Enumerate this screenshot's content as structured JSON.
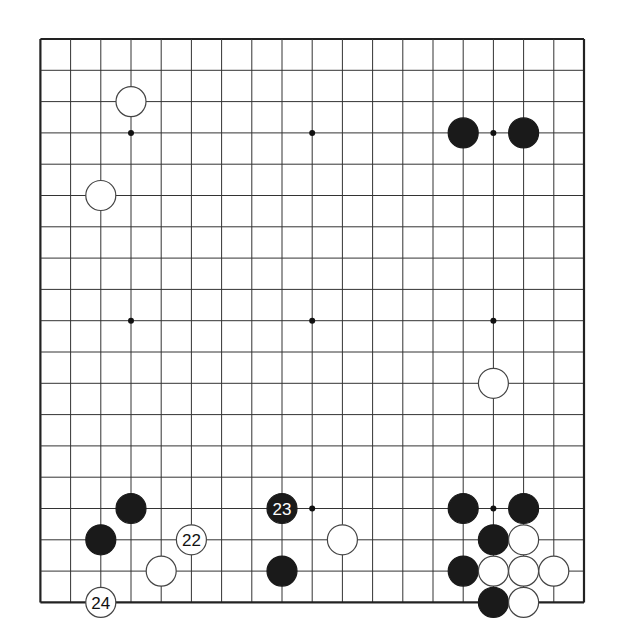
{
  "board": {
    "size": 19,
    "origin_x": 40.4,
    "origin_y": 39,
    "spacing_x": 30.2,
    "spacing_y": 31.3,
    "stone_radius": 15,
    "line_color": "#333333",
    "border_color": "#222222",
    "black_color": "#1a1a1a",
    "white_color": "#ffffff",
    "star_points": [
      [
        3,
        3
      ],
      [
        9,
        3
      ],
      [
        15,
        3
      ],
      [
        3,
        9
      ],
      [
        9,
        9
      ],
      [
        15,
        9
      ],
      [
        3,
        15
      ],
      [
        9,
        15
      ],
      [
        15,
        15
      ]
    ]
  },
  "stones": [
    {
      "color": "white",
      "col": 3,
      "row": 2,
      "label": ""
    },
    {
      "color": "white",
      "col": 2,
      "row": 5,
      "label": ""
    },
    {
      "color": "black",
      "col": 14,
      "row": 3,
      "label": ""
    },
    {
      "color": "black",
      "col": 16,
      "row": 3,
      "label": ""
    },
    {
      "color": "white",
      "col": 15,
      "row": 11,
      "label": ""
    },
    {
      "color": "black",
      "col": 3,
      "row": 15,
      "label": ""
    },
    {
      "color": "black",
      "col": 2,
      "row": 16,
      "label": ""
    },
    {
      "color": "white",
      "col": 5,
      "row": 16,
      "label": "22"
    },
    {
      "color": "white",
      "col": 4,
      "row": 17,
      "label": ""
    },
    {
      "color": "white",
      "col": 2,
      "row": 18,
      "label": "24"
    },
    {
      "color": "black",
      "col": 8,
      "row": 15,
      "label": "23"
    },
    {
      "color": "white",
      "col": 10,
      "row": 16,
      "label": ""
    },
    {
      "color": "black",
      "col": 8,
      "row": 17,
      "label": ""
    },
    {
      "color": "black",
      "col": 14,
      "row": 15,
      "label": ""
    },
    {
      "color": "black",
      "col": 16,
      "row": 15,
      "label": ""
    },
    {
      "color": "black",
      "col": 15,
      "row": 16,
      "label": ""
    },
    {
      "color": "white",
      "col": 16,
      "row": 16,
      "label": ""
    },
    {
      "color": "black",
      "col": 14,
      "row": 17,
      "label": ""
    },
    {
      "color": "white",
      "col": 15,
      "row": 17,
      "label": ""
    },
    {
      "color": "white",
      "col": 16,
      "row": 17,
      "label": ""
    },
    {
      "color": "white",
      "col": 17,
      "row": 17,
      "label": ""
    },
    {
      "color": "black",
      "col": 15,
      "row": 18,
      "label": ""
    },
    {
      "color": "white",
      "col": 16,
      "row": 18,
      "label": ""
    }
  ]
}
